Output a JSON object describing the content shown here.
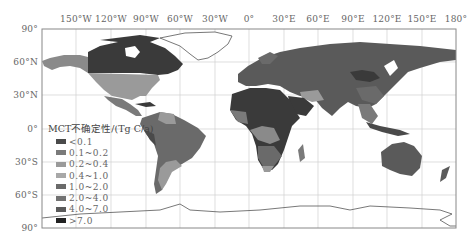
{
  "map": {
    "projection": "equirectangular",
    "x_ticks": [
      {
        "label": "150°W",
        "x": 76
      },
      {
        "label": "120°W",
        "x": 111
      },
      {
        "label": "90°W",
        "x": 146
      },
      {
        "label": "60°W",
        "x": 180
      },
      {
        "label": "30°W",
        "x": 215
      },
      {
        "label": "0°",
        "x": 249
      },
      {
        "label": "30°E",
        "x": 284
      },
      {
        "label": "60°E",
        "x": 318
      },
      {
        "label": "90°E",
        "x": 353
      },
      {
        "label": "120°E",
        "x": 387
      },
      {
        "label": "150°E",
        "x": 422
      },
      {
        "label": "180°",
        "x": 456
      }
    ],
    "y_ticks": [
      {
        "label": "90°",
        "y": 29
      },
      {
        "label": "60°N",
        "y": 62
      },
      {
        "label": "30°N",
        "y": 95
      },
      {
        "label": "0°",
        "y": 129
      },
      {
        "label": "30°S",
        "y": 162
      },
      {
        "label": "60°S",
        "y": 195
      },
      {
        "label": "90°",
        "y": 228
      }
    ]
  },
  "legend": {
    "title": "MCT不确定性/(Tg C/a)",
    "items": [
      {
        "label": "<0.1",
        "color": "#4a4a4a"
      },
      {
        "label": "0.1~0.2",
        "color": "#7a7a7a"
      },
      {
        "label": "0.2~0.4",
        "color": "#9a9a9a"
      },
      {
        "label": "0.4~1.0",
        "color": "#a8a8a8"
      },
      {
        "label": "1.0~2.0",
        "color": "#6a6a6a"
      },
      {
        "label": "2.0~4.0",
        "color": "#727272"
      },
      {
        "label": "4.0~7.0",
        "color": "#5a5a5a"
      },
      {
        "label": ">7.0",
        "color": "#222222"
      }
    ]
  }
}
